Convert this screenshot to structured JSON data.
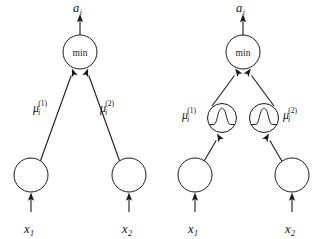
{
  "figure": {
    "background_color": "#ffffff",
    "ink_color": "#1a1a1a",
    "panels": [
      {
        "id": "left-panel",
        "name": "plain-membership-diagram",
        "output_label": {
          "base": "a",
          "sub": "i"
        },
        "min_node_label": "min",
        "inputs": [
          {
            "base": "x",
            "sub": "1"
          },
          {
            "base": "x",
            "sub": "2"
          }
        ],
        "edge_labels": [
          {
            "base": "μ",
            "sub": "i",
            "sup": "(1)"
          },
          {
            "base": "μ",
            "sub": "i",
            "sup": "(2)"
          }
        ],
        "has_membership_function_nodes": false
      },
      {
        "id": "right-panel",
        "name": "gaussian-membership-diagram",
        "output_label": {
          "base": "a",
          "sub": "i"
        },
        "min_node_label": "min",
        "inputs": [
          {
            "base": "x",
            "sub": "1"
          },
          {
            "base": "x",
            "sub": "2"
          }
        ],
        "edge_labels": [
          {
            "base": "μ",
            "sub": "i",
            "sup": "(1)"
          },
          {
            "base": "μ",
            "sub": "i",
            "sup": "(2)"
          }
        ],
        "has_membership_function_nodes": true,
        "membership_node_icon": "gaussian-bell-curve"
      }
    ]
  }
}
